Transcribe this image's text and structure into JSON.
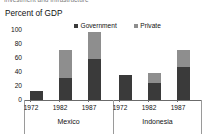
{
  "figure": {
    "clipped_heading": "Investment and Infrastructure",
    "axis_title": "Percent of GDP"
  },
  "legend": {
    "position": "top-center",
    "items": [
      {
        "label": "Government",
        "color": "#3a3a3a",
        "icon": "square-swatch"
      },
      {
        "label": "Private",
        "color": "#8e8e8e",
        "icon": "square-swatch"
      }
    ]
  },
  "yaxis": {
    "ticks": [
      "100",
      "80",
      "60",
      "40",
      "20",
      "0"
    ]
  },
  "groups": [
    {
      "name": "Mexico"
    },
    {
      "name": "Indonesia"
    }
  ],
  "bars": [
    {
      "group": "Mexico",
      "year": "1972",
      "government": 12,
      "private": 0,
      "total": 12
    },
    {
      "group": "Mexico",
      "year": "1982",
      "government": 31,
      "private": 39,
      "total": 70
    },
    {
      "group": "Mexico",
      "year": "1987",
      "government": 57,
      "private": 38,
      "total": 95
    },
    {
      "group": "Indonesia",
      "year": "1972",
      "government": 34,
      "private": 0,
      "total": 34
    },
    {
      "group": "Indonesia",
      "year": "1982",
      "government": 23,
      "private": 14,
      "total": 37
    },
    {
      "group": "Indonesia",
      "year": "1987",
      "government": 46,
      "private": 24,
      "total": 70
    }
  ],
  "chart_data": {
    "type": "bar",
    "subtype": "stacked-grouped",
    "title": "Percent of GDP",
    "subtitle": "Investment and Infrastructure",
    "xlabel": "",
    "ylabel": "Percent of GDP",
    "ylim": [
      0,
      100
    ],
    "yticks": [
      0,
      20,
      40,
      60,
      80,
      100
    ],
    "grid": false,
    "legend_position": "top-center",
    "groups": [
      "Mexico",
      "Indonesia"
    ],
    "categories": [
      "1972",
      "1982",
      "1987",
      "1972",
      "1982",
      "1987"
    ],
    "series": [
      {
        "name": "Government",
        "color": "#3a3a3a",
        "values": [
          12,
          31,
          57,
          34,
          23,
          46
        ]
      },
      {
        "name": "Private",
        "color": "#8e8e8e",
        "values": [
          0,
          39,
          38,
          0,
          14,
          24
        ]
      }
    ],
    "totals": [
      12,
      70,
      95,
      34,
      37,
      70
    ],
    "units": "percent of GDP"
  }
}
